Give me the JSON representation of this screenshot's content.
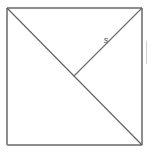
{
  "figure": {
    "type": "geometry-diagram",
    "background_color": "#ffffff",
    "stroke_color": "#808080",
    "diagonal_color": "#5a5a5a",
    "label_color": "#4a4a4a",
    "square": {
      "name": "outer-square",
      "top_left": [
        7,
        8
      ],
      "top_right": [
        142,
        8
      ],
      "bottom_right": [
        142,
        145
      ],
      "bottom_left": [
        7,
        145
      ],
      "stroke_width": 1.2
    },
    "main_diagonal": {
      "name": "diagonal-top-left-to-bottom-right",
      "from": [
        7,
        8
      ],
      "to": [
        142,
        145
      ],
      "stroke_width": 1.2
    },
    "segment": {
      "name": "segment-top-right-to-midpoint",
      "from": [
        142,
        8
      ],
      "to": [
        74,
        76
      ],
      "stroke_width": 1.2,
      "label": "s",
      "label_x": 106,
      "label_y": 43
    },
    "tick_mark": {
      "name": "right-edge-tick",
      "from": [
        146,
        41
      ],
      "to": [
        146,
        64
      ],
      "stroke_width": 1,
      "color": "#c9c9c9"
    }
  }
}
